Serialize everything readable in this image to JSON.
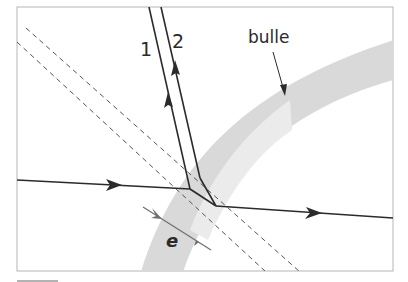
{
  "diagram": {
    "labels": {
      "ray1": "1",
      "ray2": "2",
      "bubble": "bulle",
      "thickness": "e"
    },
    "colors": {
      "frame": "#b5b5b5",
      "ray": "#2b2b2b",
      "dashed": "#555555",
      "bubble_band": "#d9d9d9",
      "bubble_inner": "#ececec",
      "thickness_arrow": "#6f6f6f"
    }
  }
}
